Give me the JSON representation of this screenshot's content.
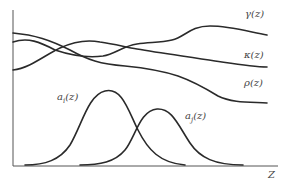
{
  "diagram": {
    "axis": {
      "x_label": "Z"
    },
    "curves": [
      {
        "id": "gamma",
        "label": "γ(z)",
        "role": "upper varying profile"
      },
      {
        "id": "kappa",
        "label": "κ(z)",
        "role": "middle varying profile"
      },
      {
        "id": "rho",
        "label": "ρ(z)",
        "role": "lower varying profile"
      },
      {
        "id": "a_i",
        "label": "a_i(z)",
        "label_main": "a",
        "label_sub": "i",
        "label_tail": "(z)",
        "role": "bell-shaped curve"
      },
      {
        "id": "a_j",
        "label": "a_j(z)",
        "label_main": "a",
        "label_sub": "j",
        "label_tail": "(z)",
        "role": "bell-shaped curve"
      }
    ],
    "colors": {
      "line": "#2a2a2a",
      "axis": "#555555",
      "text": "#444444",
      "background": "#ffffff"
    }
  }
}
